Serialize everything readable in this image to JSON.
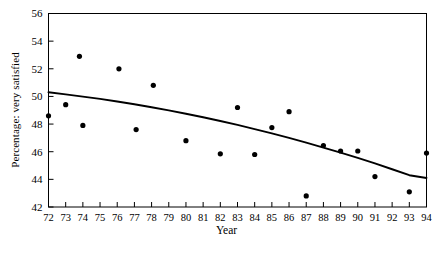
{
  "chart_data": {
    "type": "scatter",
    "title": "",
    "xlabel": "Year",
    "ylabel": "Percentage: very satisfied",
    "xlim": [
      72,
      94
    ],
    "ylim": [
      42,
      56
    ],
    "xticks": [
      72,
      73,
      74,
      75,
      76,
      77,
      78,
      79,
      80,
      81,
      82,
      83,
      84,
      85,
      86,
      87,
      88,
      89,
      90,
      91,
      92,
      93,
      94
    ],
    "xtick_labels": [
      "72",
      "73",
      "74",
      "75",
      "76",
      "77",
      "78",
      "79",
      "80",
      "81",
      "82",
      "83",
      "84",
      "85",
      "86",
      "87",
      "88",
      "89",
      "90",
      "91",
      "92",
      "93",
      "94"
    ],
    "yticks": [
      42,
      44,
      46,
      48,
      50,
      52,
      54,
      56
    ],
    "ytick_labels": [
      "42",
      "44",
      "46",
      "48",
      "50",
      "52",
      "54",
      "56"
    ],
    "grid": false,
    "legend": null,
    "marker": "filled-circle",
    "marker_color": "#000000",
    "points": [
      {
        "x": 72,
        "y": 48.6
      },
      {
        "x": 73,
        "y": 49.4
      },
      {
        "x": 73.8,
        "y": 52.9
      },
      {
        "x": 74,
        "y": 47.9
      },
      {
        "x": 76.1,
        "y": 52.0
      },
      {
        "x": 77.1,
        "y": 47.6
      },
      {
        "x": 78.1,
        "y": 50.8
      },
      {
        "x": 80,
        "y": 46.8
      },
      {
        "x": 82,
        "y": 45.85
      },
      {
        "x": 83,
        "y": 49.2
      },
      {
        "x": 84,
        "y": 45.8
      },
      {
        "x": 85,
        "y": 47.75
      },
      {
        "x": 86,
        "y": 48.9
      },
      {
        "x": 87,
        "y": 42.8
      },
      {
        "x": 88,
        "y": 46.45
      },
      {
        "x": 89,
        "y": 46.05
      },
      {
        "x": 90,
        "y": 46.05
      },
      {
        "x": 91,
        "y": 44.2
      },
      {
        "x": 93,
        "y": 43.1
      },
      {
        "x": 94,
        "y": 45.9
      }
    ],
    "series": [
      {
        "name": "fitted-trend",
        "type": "line",
        "color": "#000000",
        "x": [
          72,
          73,
          74,
          75,
          76,
          77,
          78,
          79,
          80,
          81,
          82,
          83,
          84,
          85,
          86,
          87,
          88,
          89,
          90,
          91,
          92,
          93,
          94
        ],
        "values": [
          50.3,
          50.15,
          49.99,
          49.82,
          49.63,
          49.43,
          49.22,
          48.99,
          48.75,
          48.49,
          48.22,
          47.94,
          47.64,
          47.33,
          47.0,
          46.66,
          46.3,
          45.93,
          45.55,
          45.15,
          44.73,
          44.3,
          44.1
        ]
      }
    ]
  }
}
